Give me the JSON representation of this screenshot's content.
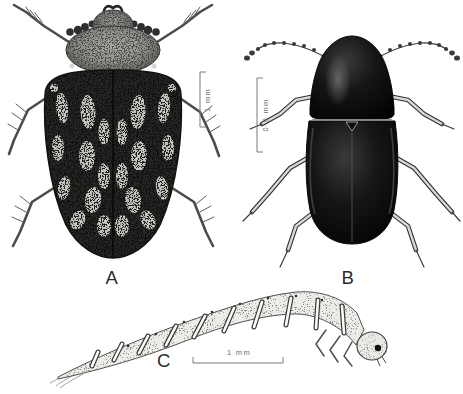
{
  "colors": {
    "background": "#ffffff",
    "ink": "#1b1b1b",
    "label_text": "#2d2d2d",
    "scale_text": "#6b6b6b"
  },
  "panels": {
    "a": {
      "label": "A",
      "subject": "adult beetle, dorsal view, mottled elytra",
      "scale_label": "1 mm"
    },
    "b": {
      "label": "B",
      "subject": "adult beetle, dorsal view, dark elongate body",
      "scale_label": "0·5 mm"
    },
    "c": {
      "label": "C",
      "subject": "beetle larva, lateral view",
      "scale_label": "1 mm"
    }
  }
}
